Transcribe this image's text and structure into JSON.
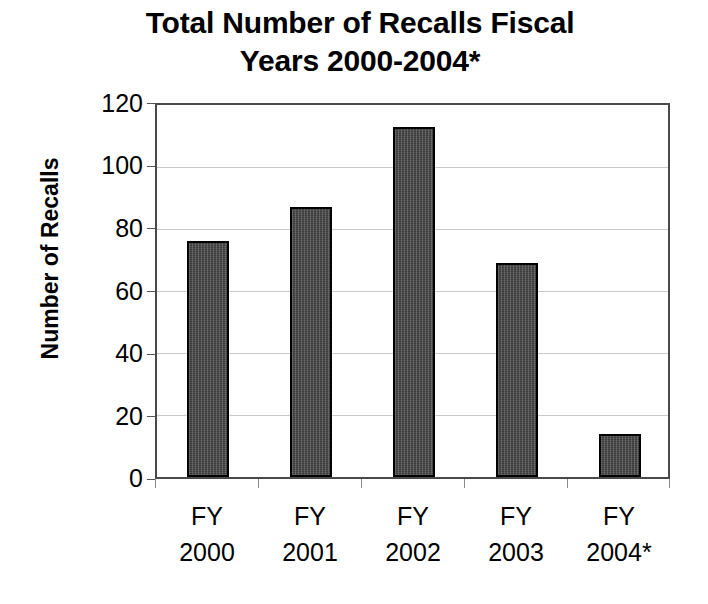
{
  "chart_data": {
    "type": "bar",
    "title": "Total Number of Recalls Fiscal Years 2000-2004*",
    "title_lines": [
      "Total Number of Recalls Fiscal",
      "Years 2000-2004*"
    ],
    "xlabel": "",
    "ylabel": "Number of Recalls",
    "categories": [
      "FY 2000",
      "FY 2001",
      "FY 2002",
      "FY 2003",
      "FY 2004*"
    ],
    "category_lines": [
      [
        "FY",
        "2000"
      ],
      [
        "FY",
        "2001"
      ],
      [
        "FY",
        "2002"
      ],
      [
        "FY",
        "2003"
      ],
      [
        "FY",
        "2004*"
      ]
    ],
    "values": [
      76,
      87,
      113,
      69,
      14
    ],
    "ylim": [
      0,
      120
    ],
    "yticks": [
      0,
      20,
      40,
      60,
      80,
      100,
      120
    ],
    "ytick_labels": [
      "0",
      "20",
      "40",
      "60",
      "80",
      "100",
      "120"
    ],
    "grid": true,
    "legend": false,
    "legend_position": "none",
    "colors": {
      "bar_fill": "#3b3b3b",
      "bar_outline": "#000000",
      "gridline": "#c9c9c9",
      "axis": "#4a4a4a",
      "text": "#000000",
      "background": "#ffffff"
    }
  }
}
